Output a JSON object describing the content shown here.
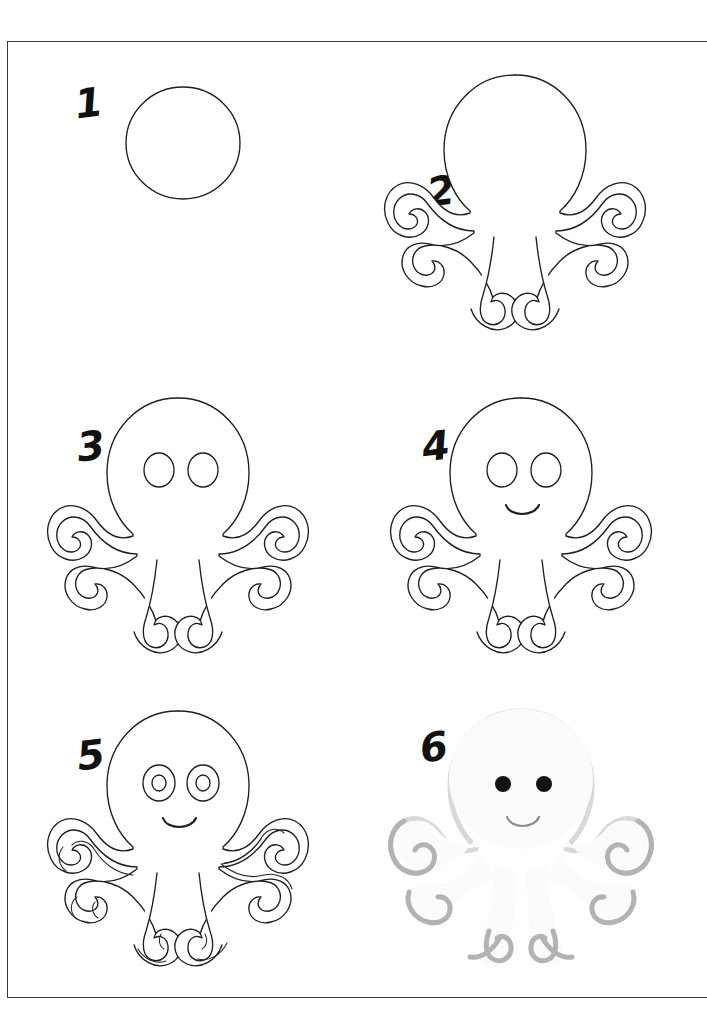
{
  "page": {
    "background_color": "#ffffff",
    "border_color": "#3a3a3a",
    "ink_color": "#1e1e1e"
  },
  "steps": [
    {
      "number": "1",
      "name": "step-1-circle",
      "description": "Draw an oval for the head",
      "features": [
        "head-oval"
      ]
    },
    {
      "number": "2",
      "name": "step-2-tentacles",
      "description": "Add the curling tentacles around the head",
      "features": [
        "head-oval",
        "tentacles"
      ]
    },
    {
      "number": "3",
      "name": "step-3-eyes",
      "description": "Add two round eyes",
      "features": [
        "head-oval",
        "tentacles",
        "eyes"
      ]
    },
    {
      "number": "4",
      "name": "step-4-smile",
      "description": "Add a smiling mouth",
      "features": [
        "head-oval",
        "tentacles",
        "eyes",
        "smile"
      ]
    },
    {
      "number": "5",
      "name": "step-5-details",
      "description": "Add pupils and extra outlines on the tentacles",
      "features": [
        "head-oval",
        "tentacles",
        "eyes",
        "pupils",
        "smile",
        "tentacle-outlines"
      ]
    },
    {
      "number": "6",
      "name": "step-6-colour",
      "description": "Colour the octopus in",
      "features": [
        "coloured-body",
        "shadow",
        "black-eyes",
        "smile"
      ],
      "colors": {
        "body": "#fbfbfc",
        "shadow": "#b3b3b3",
        "shadow_soft": "#d8d8d8",
        "eye": "#131313",
        "smile": "#8d8d8d"
      }
    }
  ]
}
